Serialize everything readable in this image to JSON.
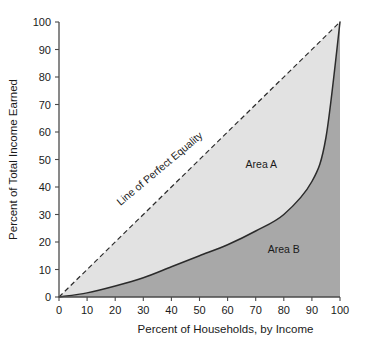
{
  "chart_data": {
    "type": "line",
    "title": "",
    "xlabel": "Percent of Households, by Income",
    "ylabel": "Percent of Total Income Earned",
    "xlim": [
      0,
      100
    ],
    "ylim": [
      0,
      100
    ],
    "grid": false,
    "legend_position": "none",
    "x_ticks": [
      "0",
      "10",
      "20",
      "30",
      "40",
      "50",
      "60",
      "70",
      "80",
      "90",
      "100"
    ],
    "y_ticks": [
      "0",
      "10",
      "20",
      "30",
      "40",
      "50",
      "60",
      "70",
      "80",
      "90",
      "100"
    ],
    "series": [
      {
        "name": "Line of Perfect Equality",
        "style": "dashed",
        "x": [
          0,
          100
        ],
        "values": [
          0,
          100
        ]
      },
      {
        "name": "Lorenz Curve",
        "style": "solid",
        "x": [
          0,
          10,
          20,
          30,
          40,
          50,
          60,
          70,
          80,
          90,
          95,
          100
        ],
        "values": [
          0,
          1.5,
          4,
          7,
          11,
          15,
          19,
          24,
          30,
          42,
          58,
          100
        ]
      }
    ],
    "annotations": [
      {
        "text": "Line of Perfect Equality",
        "x": 38,
        "y": 44,
        "rotation": -40
      },
      {
        "text": "Area A",
        "x": 72,
        "y": 47
      },
      {
        "text": "Area B",
        "x": 80,
        "y": 16
      }
    ],
    "colors": {
      "area_a_fill": "#e2e2e2",
      "area_b_fill": "#a8a8a8",
      "curve_stroke": "#2b2b2b",
      "equality_stroke": "#2b2b2b",
      "axis": "#4a4a4a",
      "text": "#1a1a1a",
      "background": "#ffffff"
    }
  },
  "axes": {
    "x_title": "Percent of Households, by Income",
    "y_title": "Percent of Total Income Earned"
  },
  "labels": {
    "line_of_perfect_equality": "Line of Perfect Equality",
    "area_a": "Area A",
    "area_b": "Area B"
  },
  "ticks": {
    "x": [
      "0",
      "10",
      "20",
      "30",
      "40",
      "50",
      "60",
      "70",
      "80",
      "90",
      "100"
    ],
    "y": [
      "0",
      "10",
      "20",
      "30",
      "40",
      "50",
      "60",
      "70",
      "80",
      "90",
      "100"
    ]
  }
}
